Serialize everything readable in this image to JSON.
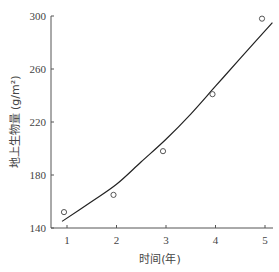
{
  "chart_data": {
    "type": "scatter",
    "title": "",
    "xlabel": "时间(年)",
    "ylabel": "地上生物量 (g/m²)",
    "xlim": [
      0.68,
      5.15
    ],
    "ylim": [
      140,
      300
    ],
    "x_ticks": [
      1,
      2,
      3,
      4,
      5
    ],
    "y_ticks": [
      140,
      180,
      220,
      260,
      300
    ],
    "grid": false,
    "legend": null,
    "series": [
      {
        "name": "observed",
        "type": "scatter",
        "marker": "open-circle",
        "x": [
          1,
          2,
          3,
          4,
          5
        ],
        "y": [
          152,
          165,
          198,
          241,
          298
        ]
      },
      {
        "name": "fitted curve",
        "type": "line",
        "x": [
          0.9,
          1.5,
          2,
          2.5,
          3,
          3.5,
          4,
          4.5,
          5.15
        ],
        "y": [
          145,
          160,
          173,
          190,
          207,
          226,
          247,
          268,
          295
        ]
      }
    ]
  }
}
